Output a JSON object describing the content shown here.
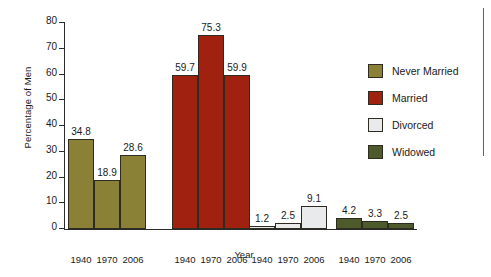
{
  "chart_data": {
    "type": "bar",
    "title": "",
    "xlabel": "Year",
    "ylabel": "Percentage of Men",
    "categories": [
      "1940",
      "1970",
      "2006"
    ],
    "ylim": [
      0,
      80
    ],
    "ytick_labels": [
      "0",
      "10",
      "20",
      "30",
      "40",
      "50",
      "60",
      "70",
      "80"
    ],
    "yticks": [
      0,
      10,
      20,
      30,
      40,
      50,
      60,
      70,
      80
    ],
    "grid": false,
    "legend_position": "right",
    "series": [
      {
        "name": "Never Married",
        "color": "#8a8036",
        "values": [
          34.8,
          18.9,
          28.6
        ],
        "value_labels": [
          "34.8",
          "18.9",
          "28.6"
        ]
      },
      {
        "name": "Married",
        "color": "#a0210f",
        "values": [
          59.7,
          75.3,
          59.9
        ],
        "value_labels": [
          "59.7",
          "75.3",
          "59.9"
        ]
      },
      {
        "name": "Divorced",
        "color": "#e8eaec",
        "values": [
          1.2,
          2.5,
          9.1
        ],
        "value_labels": [
          "1.2",
          "2.5",
          "9.1"
        ]
      },
      {
        "name": "Widowed",
        "color": "#4c5a2c",
        "values": [
          4.2,
          3.3,
          2.5
        ],
        "value_labels": [
          "4.2",
          "3.3",
          "2.5"
        ]
      }
    ]
  },
  "legend": {
    "items": [
      {
        "label": "Never Married",
        "color": "#8a8036"
      },
      {
        "label": "Married",
        "color": "#a0210f"
      },
      {
        "label": "Divorced",
        "color": "#e8eaec"
      },
      {
        "label": "Widowed",
        "color": "#4c5a2c"
      }
    ]
  },
  "axes": {
    "y_title": "Percentage of Men",
    "x_title": "Year"
  }
}
